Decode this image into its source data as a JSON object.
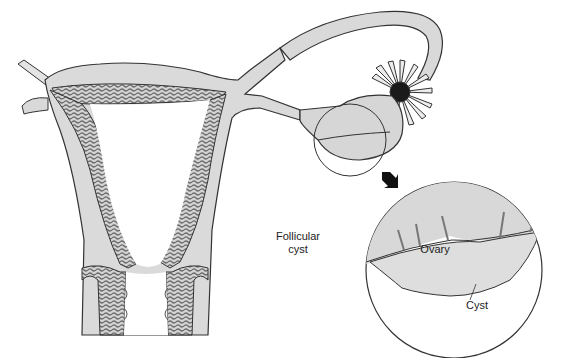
{
  "figure": {
    "colors": {
      "tissue_fill": "#d9d9d9",
      "endometrium_fill": "#cfcfcf",
      "outline": "#333333",
      "background": "#ffffff",
      "arrow": "#111111"
    },
    "labels": {
      "follicular_line1": "Follicular",
      "follicular_line2": "cyst",
      "ovary": "Ovary",
      "cyst": "Cyst"
    },
    "inset": {
      "title": "Magnified ovary with cyst",
      "arrow_direction": "down-right"
    }
  }
}
